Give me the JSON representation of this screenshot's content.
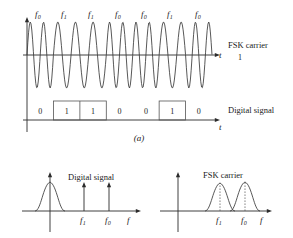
{
  "figure": {
    "caption": "(a)",
    "panel_a": {
      "carrier_label": "FSK carrier",
      "carrier_axis_label": "t",
      "carrier_level_label": "1",
      "digital_label": "Digital signal",
      "digital_axis_label": "t",
      "freq_labels": [
        "f0",
        "f1",
        "f1",
        "f0",
        "f0",
        "f1",
        "f0"
      ],
      "freq_label_base": "f",
      "freq_label_subs": [
        "0",
        "1",
        "1",
        "0",
        "0",
        "1",
        "0"
      ],
      "bits": [
        "0",
        "1",
        "1",
        "0",
        "0",
        "1",
        "0"
      ],
      "bit_values": [
        0,
        1,
        1,
        0,
        0,
        1,
        0
      ],
      "segment_cycles": [
        2,
        1.5,
        1.5,
        2,
        2,
        1.5,
        2
      ]
    },
    "panel_left": {
      "title": "Digital signal",
      "axis_label": "f",
      "tick_labels": [
        "f1",
        "f0"
      ],
      "tick_base": "f",
      "tick_subs": [
        "1",
        "0"
      ],
      "impulse_count": 2
    },
    "panel_right": {
      "title": "FSK carrier",
      "axis_label": "f",
      "tick_labels": [
        "f1",
        "f0"
      ],
      "tick_base": "f",
      "tick_subs": [
        "1",
        "0"
      ],
      "lobe_count": 2
    }
  },
  "colors": {
    "ink": "#1a1a1a",
    "line": "#2b2b2b",
    "wave": "#3a3a3a",
    "box": "#555555",
    "background": "#ffffff"
  }
}
